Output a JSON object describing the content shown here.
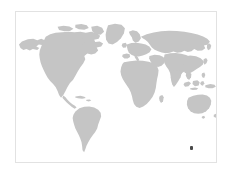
{
  "figure": {
    "type": "world-map",
    "title": "",
    "projection": "equirectangular",
    "width": 232,
    "height": 174,
    "background_color": "#ffffff",
    "frame": {
      "border_color": "#e2e2e2",
      "border_width": 1,
      "x": 15,
      "y": 11,
      "width": 202,
      "height": 152
    },
    "land_color": "#c5c5c5",
    "ocean_color": "#ffffff"
  },
  "chart_data": {
    "type": "scatter",
    "title": "",
    "subtitle": "",
    "xlabel": "",
    "ylabel": "",
    "grid": false,
    "legend": null,
    "xlim": [
      -180,
      180
    ],
    "ylim": [
      -90,
      90
    ],
    "basemap": "world-landmasses",
    "series": [
      {
        "name": "location",
        "marker_color": "#4a4a4a",
        "marker_size": 3,
        "points": [
          {
            "label": "",
            "lon": 145.0,
            "lat": -38.0,
            "x_px": 190,
            "y_px": 147
          }
        ]
      }
    ],
    "landmass_labels": [
      "North America",
      "South America",
      "Greenland",
      "Europe",
      "Africa",
      "Asia",
      "Australia",
      "New Zealand",
      "Indonesia",
      "Japan",
      "Madagascar",
      "United Kingdom",
      "Iceland"
    ]
  },
  "markers": {
    "count": 1,
    "color": "#4a4a4a"
  }
}
